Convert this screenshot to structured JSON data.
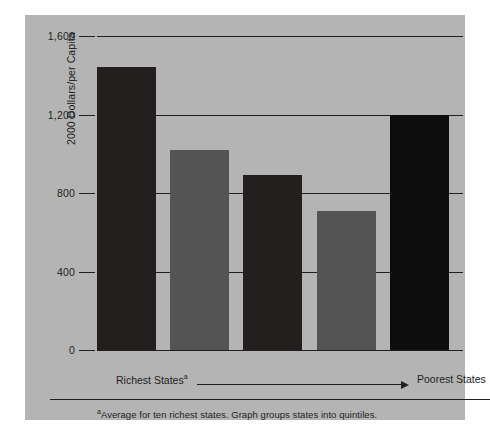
{
  "figure": {
    "panel_color": "#b4b4b4",
    "ink_color": "#231f1e",
    "background_color": "#ffffff"
  },
  "axis": {
    "y_title": "2000 Dollars/per Capita",
    "y_ticks": [
      "1,600",
      "1,200",
      "800",
      "400",
      "0"
    ],
    "x_left_label": "Richest States",
    "x_left_superscript": "a",
    "x_right_label": "Poorest States",
    "direction_arrow": "right-arrow"
  },
  "footnote": {
    "marker": "a",
    "text": "Average for ten richest states. Graph groups states into quintiles."
  },
  "chart_data": {
    "type": "bar",
    "title": "",
    "subtitle": "",
    "xlabel": "",
    "ylabel": "2000 Dollars/per Capita",
    "ylim": [
      0,
      1600
    ],
    "ytick_values": [
      0,
      400,
      800,
      1200,
      1600
    ],
    "ytick_labels": [
      "0",
      "400",
      "800",
      "1,200",
      "1,600"
    ],
    "grid": true,
    "grid_axis": "y",
    "legend": false,
    "legend_position": "none",
    "categories": [
      "Quintile 1 (Richest)",
      "Quintile 2",
      "Quintile 3",
      "Quintile 4",
      "Quintile 5 (Poorest)"
    ],
    "values": [
      1440,
      1020,
      890,
      710,
      1200
    ],
    "bar_colors": [
      "#231f1e",
      "#545454",
      "#231f1e",
      "#545454",
      "#0d0d0d"
    ],
    "annotations": [
      "Richest Statesᵃ",
      "Poorest States",
      "ᵃAverage for ten richest states. Graph groups states into quintiles."
    ]
  }
}
